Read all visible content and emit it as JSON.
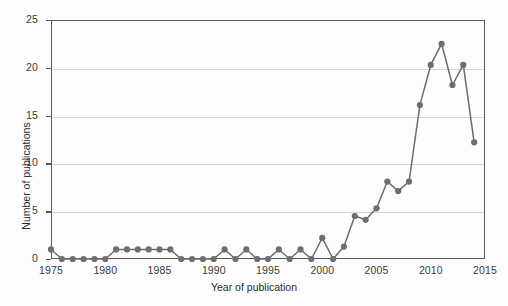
{
  "chart_data": {
    "type": "line",
    "title": "",
    "xlabel": "Year of publication",
    "ylabel": "Number of publications",
    "xlim": [
      1975,
      2015
    ],
    "ylim": [
      0,
      25
    ],
    "grid": true,
    "legend": "none",
    "marker": "circle",
    "series_color": "#6e6e6e",
    "line_color": "#6b6b6b",
    "x": [
      1975,
      1976,
      1977,
      1978,
      1979,
      1980,
      1981,
      1982,
      1983,
      1984,
      1985,
      1986,
      1987,
      1988,
      1989,
      1990,
      1991,
      1992,
      1993,
      1994,
      1995,
      1996,
      1997,
      1998,
      1999,
      2000,
      2001,
      2002,
      2003,
      2004,
      2005,
      2006,
      2007,
      2008,
      2009,
      2010,
      2011,
      2012,
      2013,
      2014
    ],
    "values": [
      1,
      0,
      0,
      0,
      0,
      0,
      1,
      1,
      1,
      1,
      1,
      1,
      0,
      0,
      0,
      0,
      1,
      0,
      1,
      0,
      0,
      1,
      0,
      1,
      0,
      2.2,
      0,
      1.3,
      4.5,
      4.1,
      5.3,
      8.1,
      7.1,
      8.1,
      16.1,
      20.3,
      22.5,
      18.2,
      20.3,
      12.2
    ],
    "xticks": [
      1975,
      1980,
      1985,
      1990,
      1995,
      2000,
      2005,
      2010,
      2015
    ],
    "yticks": [
      0,
      5,
      10,
      15,
      20,
      25
    ],
    "xtick_labels": [
      "1975",
      "1980",
      "1985",
      "1990",
      "1995",
      "2000",
      "2005",
      "2010",
      "2015"
    ],
    "ytick_labels": [
      "0",
      "5",
      "10",
      "15",
      "20",
      "25"
    ]
  },
  "axes": {
    "x_title": "Year of publication",
    "y_title": "Number of publications"
  }
}
